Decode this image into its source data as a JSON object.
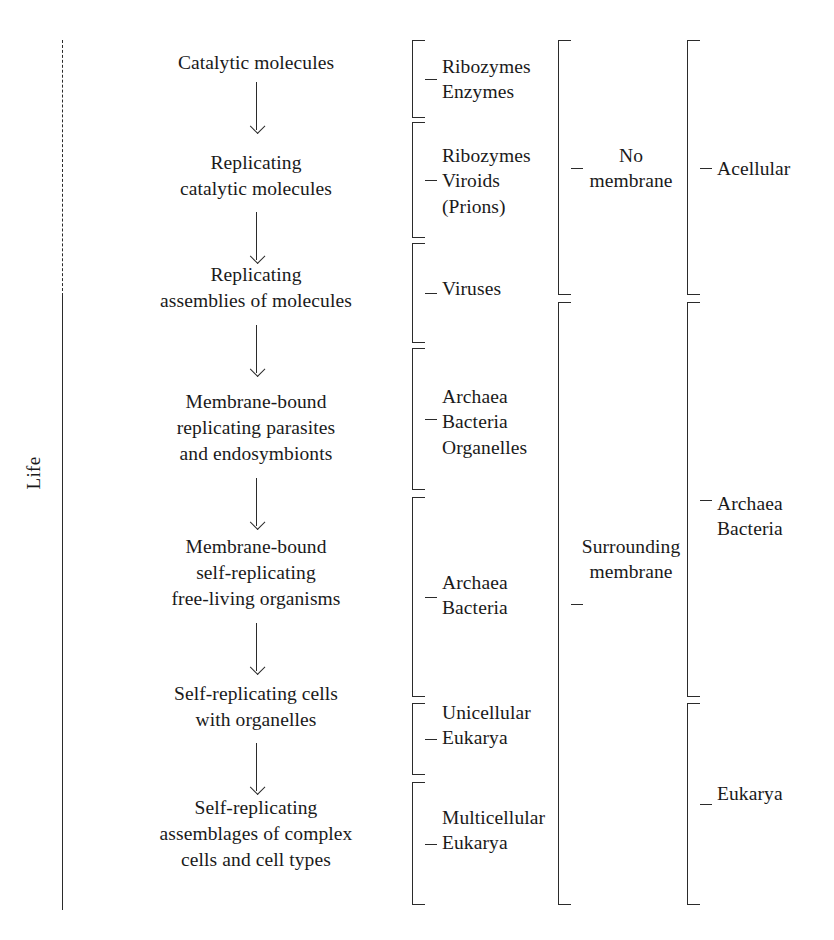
{
  "diagram": {
    "axis": {
      "label": "Life",
      "dashed_top": true
    },
    "stages": [
      {
        "text": "Catalytic molecules",
        "y": 50,
        "arrow_top": 82,
        "arrow_height": 48
      },
      {
        "text": "Replicating\ncatalytic molecules",
        "y": 150,
        "arrow_top": 212,
        "arrow_height": 48
      },
      {
        "text": "Replicating\nassemblies of molecules",
        "y": 262,
        "arrow_top": 325,
        "arrow_height": 48
      },
      {
        "text": "Membrane-bound\nreplicating parasites\nand endosymbionts",
        "y": 389,
        "arrow_top": 478,
        "arrow_height": 48
      },
      {
        "text": "Membrane-bound\nself-replicating\nfree-living organisms",
        "y": 534,
        "arrow_top": 623,
        "arrow_height": 48
      },
      {
        "text": "Self-replicating cells\nwith organelles",
        "y": 681,
        "arrow_top": 743,
        "arrow_height": 48
      },
      {
        "text": "Self-replicating\nassemblages of complex\ncells and cell types",
        "y": 795,
        "arrow_top": 0,
        "arrow_height": 0
      }
    ],
    "columns": [
      {
        "name": "organism-types",
        "brackets": [
          {
            "label": "Ribozymes\nEnzymes",
            "top": 40,
            "bottom": 118,
            "label_y": 54
          },
          {
            "label": "Ribozymes\nViroids\n(Prions)",
            "top": 122,
            "bottom": 238,
            "label_y": 143
          },
          {
            "label": "Viruses",
            "top": 243,
            "bottom": 343,
            "label_y": 276
          },
          {
            "label": "Archaea\nBacteria\nOrganelles",
            "top": 348,
            "bottom": 490,
            "label_y": 384
          },
          {
            "label": "Archaea\nBacteria",
            "top": 497,
            "bottom": 697,
            "label_y": 570
          },
          {
            "label": "Unicellular\nEukarya",
            "top": 703,
            "bottom": 775,
            "label_y": 700
          },
          {
            "label": "Multicellular\nEukarya",
            "top": 782,
            "bottom": 905,
            "label_y": 805
          }
        ]
      },
      {
        "name": "membrane-status",
        "brackets": [
          {
            "label": "No\nmembrane",
            "top": 40,
            "bottom": 295,
            "label_y": 143
          },
          {
            "label": "Surrounding\nmembrane",
            "top": 302,
            "bottom": 905,
            "label_y": 534
          }
        ]
      },
      {
        "name": "cellularity",
        "brackets": [
          {
            "label": "Acellular",
            "top": 40,
            "bottom": 295,
            "label_y": 156
          },
          {
            "label": "Archaea\nBacteria",
            "top": 302,
            "bottom": 697,
            "label_y": 491
          },
          {
            "label": "Eukarya",
            "top": 703,
            "bottom": 905,
            "label_y": 781
          }
        ]
      }
    ]
  }
}
